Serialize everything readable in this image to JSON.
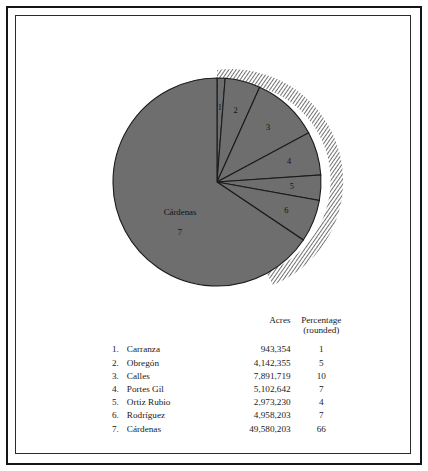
{
  "figure": {
    "title": "",
    "pie_center_label": "Cárdenas",
    "pie_center_number": "7",
    "slice_numbers": [
      "1",
      "2",
      "3",
      "4",
      "5",
      "6",
      "7"
    ],
    "colors": {
      "slice_fill": "#6e6e6e",
      "slice_stroke": "#1b1b1b",
      "hatch": "#2a2a2a",
      "frame": "#151515",
      "text": "#1a1a1a"
    }
  },
  "table": {
    "headers": {
      "rank": "",
      "name": "",
      "acres": "Acres",
      "percentage_line1": "Percentage",
      "percentage_line2": "(rounded)"
    },
    "rows": [
      {
        "rank": "1.",
        "name": "Carranza",
        "acres": "943,354",
        "percentage": "1"
      },
      {
        "rank": "2.",
        "name": "Obregón",
        "acres": "4,142,355",
        "percentage": "5"
      },
      {
        "rank": "3.",
        "name": "Calles",
        "acres": "7,891,719",
        "percentage": "10"
      },
      {
        "rank": "4.",
        "name": "Portes Gil",
        "acres": "5,102,642",
        "percentage": "7"
      },
      {
        "rank": "5.",
        "name": "Ortiz Rubio",
        "acres": "2,973,230",
        "percentage": "4"
      },
      {
        "rank": "6.",
        "name": "Rodríguez",
        "acres": "4,958,203",
        "percentage": "7"
      },
      {
        "rank": "7.",
        "name": "Cárdenas",
        "acres": "49,580,203",
        "percentage": "66"
      }
    ]
  },
  "chart_data": {
    "type": "pie",
    "title": "",
    "xlabel": "",
    "ylabel": "",
    "legend_position": "below-as-table",
    "grid": false,
    "start_angle_deg": 0,
    "direction": "clockwise",
    "value_unit": "acres",
    "categories": [
      "Carranza",
      "Obregón",
      "Calles",
      "Portes Gil",
      "Ortiz Rubio",
      "Rodríguez",
      "Cárdenas"
    ],
    "values": [
      943354,
      4142355,
      7891719,
      5102642,
      2973230,
      4958203,
      49580203
    ],
    "percentages": [
      1,
      5,
      10,
      7,
      4,
      7,
      66
    ],
    "slice_labels": [
      "1",
      "2",
      "3",
      "4",
      "5",
      "6",
      "7"
    ],
    "total_acres": 75591706,
    "annotations": [
      "Cárdenas",
      "7"
    ]
  }
}
